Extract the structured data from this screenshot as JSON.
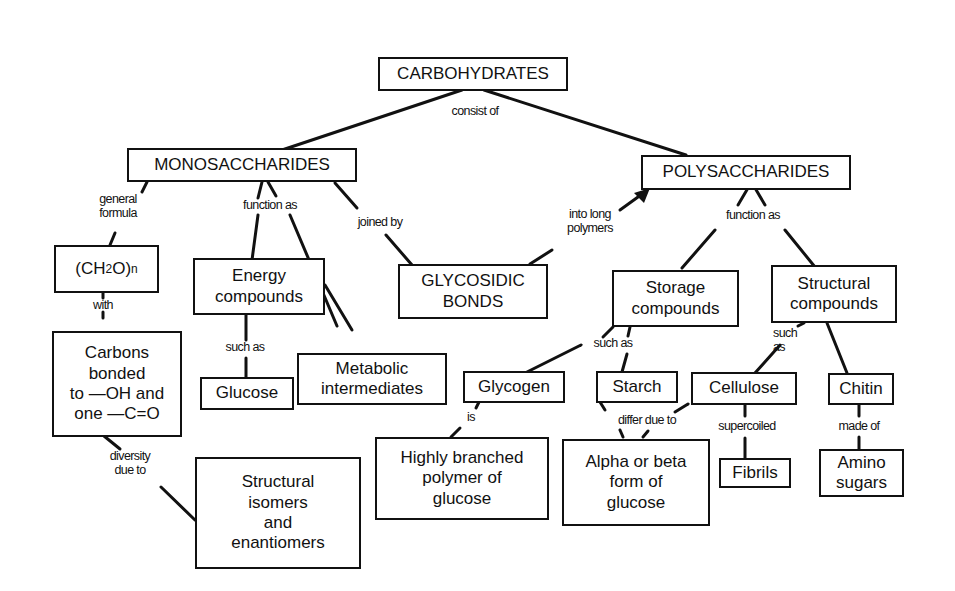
{
  "diagram": {
    "nodes": {
      "carbohydrates": "CARBOHYDRATES",
      "monosaccharides": "MONOSACCHARIDES",
      "polysaccharides": "POLYSACCHARIDES",
      "formula_prefix": "(CH",
      "formula_sub": "2",
      "formula_mid": "O)",
      "formula_n": "n",
      "carbons_bonded": "Carbons\nbonded\nto —OH and\none —C=O",
      "energy_compounds": "Energy\ncompounds",
      "glucose": "Glucose",
      "metabolic_intermediates": "Metabolic\nintermediates",
      "glycosidic_bonds": "GLYCOSIDIC\nBONDS",
      "structural_isomers": "Structural\nisomers\nand\nenantiomers",
      "storage_compounds": "Storage\ncompounds",
      "structural_compounds": "Structural\ncompounds",
      "glycogen": "Glycogen",
      "starch": "Starch",
      "cellulose": "Cellulose",
      "chitin": "Chitin",
      "highly_branched": "Highly branched\npolymer of\nglucose",
      "alpha_beta": "Alpha or beta\nform of\nglucose",
      "fibrils": "Fibrils",
      "amino_sugars": "Amino\nsugars"
    },
    "links": {
      "consist_of": "consist of",
      "general_formula": "general\nformula",
      "function_as_mono": "function as",
      "joined_by": "joined by",
      "into_long_polymers": "into long\npolymers",
      "function_as_poly": "function as",
      "with": "with",
      "such_as_energy": "such as",
      "diversity_due_to": "diversity\ndue to",
      "such_as_storage": "such as",
      "such_as_structural": "such\nas",
      "is": "is",
      "differ_due_to": "differ due to",
      "supercoiled": "supercoiled",
      "made_of": "made of"
    }
  }
}
